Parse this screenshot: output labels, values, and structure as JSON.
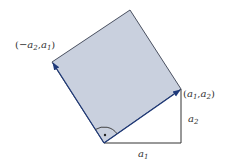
{
  "diagram": {
    "colors": {
      "square_fill": "#c9d0de",
      "square_edge": "#4a5060",
      "vector": "#1f3a7a",
      "leg": "#333333"
    },
    "labels": {
      "left_vertex": {
        "open": "(",
        "minus": "−",
        "a": "a",
        "sub1": "2",
        "comma": ",",
        "b": "a",
        "sub2": "1",
        "close": ")"
      },
      "right_vertex": {
        "open": "(",
        "a": "a",
        "sub1": "1",
        "comma": ",",
        "b": "a",
        "sub2": "2",
        "close": ")"
      },
      "leg_vertical": {
        "a": "a",
        "sub": "2"
      },
      "leg_horizontal": {
        "a": "a",
        "sub": "1"
      }
    },
    "vectors": [
      {
        "name": "a",
        "components": [
          "a1",
          "a2"
        ]
      },
      {
        "name": "perp-a",
        "components": [
          "-a2",
          "a1"
        ]
      }
    ],
    "right_angle_marker": true
  }
}
